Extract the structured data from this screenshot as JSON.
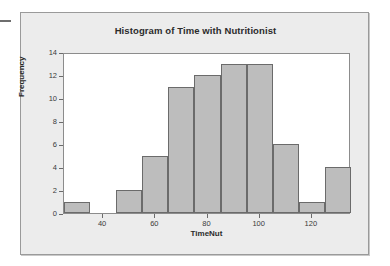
{
  "window": {
    "background_color": "#ffffff",
    "panel_color": "#ececec",
    "panel_border_color": "#9a9a9a"
  },
  "chart_data": {
    "type": "bar",
    "subtype": "histogram",
    "title": "Histogram of Time with Nutritionist",
    "xlabel": "TimeNut",
    "ylabel": "Frequency",
    "grid": false,
    "legend": null,
    "bar_color": "#bdbdbd",
    "bar_edge_color": "#6b6b6b",
    "plot_background": "#ffffff",
    "xlim": [
      25,
      135
    ],
    "ylim": [
      0,
      14
    ],
    "bin_width": 10,
    "xticks": [
      40,
      60,
      80,
      100,
      120
    ],
    "yticks": [
      0,
      2,
      4,
      6,
      8,
      10,
      12,
      14
    ],
    "bins": [
      {
        "start": 25,
        "end": 35,
        "center": 30,
        "frequency": 1
      },
      {
        "start": 35,
        "end": 45,
        "center": 40,
        "frequency": 0
      },
      {
        "start": 45,
        "end": 55,
        "center": 50,
        "frequency": 2
      },
      {
        "start": 55,
        "end": 65,
        "center": 60,
        "frequency": 5
      },
      {
        "start": 65,
        "end": 75,
        "center": 70,
        "frequency": 11
      },
      {
        "start": 75,
        "end": 85,
        "center": 80,
        "frequency": 12
      },
      {
        "start": 85,
        "end": 95,
        "center": 90,
        "frequency": 13
      },
      {
        "start": 95,
        "end": 105,
        "center": 100,
        "frequency": 13
      },
      {
        "start": 105,
        "end": 115,
        "center": 110,
        "frequency": 6
      },
      {
        "start": 115,
        "end": 125,
        "center": 120,
        "frequency": 1
      },
      {
        "start": 125,
        "end": 135,
        "center": 130,
        "frequency": 4
      }
    ],
    "values": [
      1,
      0,
      2,
      5,
      11,
      12,
      13,
      13,
      6,
      1,
      4
    ],
    "categories": [
      "25-35",
      "35-45",
      "45-55",
      "55-65",
      "65-75",
      "75-85",
      "85-95",
      "95-105",
      "105-115",
      "115-125",
      "125-135"
    ],
    "total_count": 68
  }
}
